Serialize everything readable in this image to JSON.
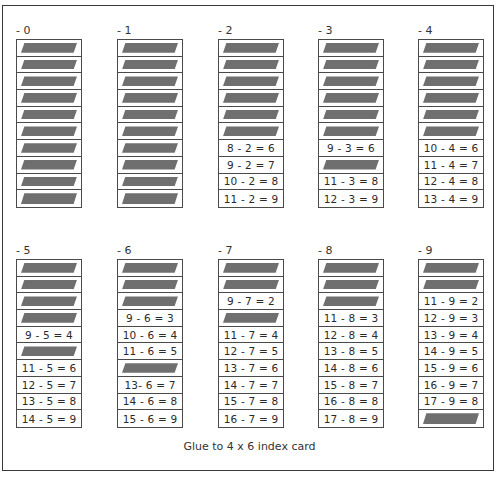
{
  "card": {
    "footer_text": "Glue to 4 x 6 index card"
  },
  "colors": {
    "bar": "#6f6f6f",
    "border": "#4a4a4a",
    "text": "#2a2a2a"
  },
  "columns": [
    {
      "label": "- 0",
      "cells": [
        {
          "type": "bar"
        },
        {
          "type": "bar"
        },
        {
          "type": "bar"
        },
        {
          "type": "bar"
        },
        {
          "type": "bar"
        },
        {
          "type": "bar"
        },
        {
          "type": "bar"
        },
        {
          "type": "bar"
        },
        {
          "type": "bar"
        },
        {
          "type": "bar"
        }
      ]
    },
    {
      "label": "- 1",
      "cells": [
        {
          "type": "bar"
        },
        {
          "type": "bar"
        },
        {
          "type": "bar"
        },
        {
          "type": "bar"
        },
        {
          "type": "bar"
        },
        {
          "type": "bar"
        },
        {
          "type": "bar"
        },
        {
          "type": "bar"
        },
        {
          "type": "bar"
        },
        {
          "type": "bar"
        }
      ]
    },
    {
      "label": "- 2",
      "cells": [
        {
          "type": "bar"
        },
        {
          "type": "bar"
        },
        {
          "type": "bar"
        },
        {
          "type": "bar"
        },
        {
          "type": "bar"
        },
        {
          "type": "bar"
        },
        {
          "type": "text",
          "text": "8 - 2 = 6"
        },
        {
          "type": "text",
          "text": "9 - 2 = 7"
        },
        {
          "type": "text",
          "text": "10 - 2 = 8"
        },
        {
          "type": "text",
          "text": "11 - 2 = 9"
        }
      ]
    },
    {
      "label": "- 3",
      "cells": [
        {
          "type": "bar"
        },
        {
          "type": "bar"
        },
        {
          "type": "bar"
        },
        {
          "type": "bar"
        },
        {
          "type": "bar"
        },
        {
          "type": "bar"
        },
        {
          "type": "text",
          "text": "9 - 3 = 6"
        },
        {
          "type": "bar"
        },
        {
          "type": "text",
          "text": "11 - 3 = 8"
        },
        {
          "type": "text",
          "text": "12 - 3 = 9"
        }
      ]
    },
    {
      "label": "- 4",
      "cells": [
        {
          "type": "bar"
        },
        {
          "type": "bar"
        },
        {
          "type": "bar"
        },
        {
          "type": "bar"
        },
        {
          "type": "bar"
        },
        {
          "type": "bar"
        },
        {
          "type": "text",
          "text": "10 - 4 = 6"
        },
        {
          "type": "text",
          "text": "11 - 4 = 7"
        },
        {
          "type": "text",
          "text": "12 - 4 = 8"
        },
        {
          "type": "text",
          "text": "13 - 4 = 9"
        }
      ]
    },
    {
      "label": "- 5",
      "cells": [
        {
          "type": "bar"
        },
        {
          "type": "bar"
        },
        {
          "type": "bar"
        },
        {
          "type": "bar"
        },
        {
          "type": "text",
          "text": "9 - 5 = 4"
        },
        {
          "type": "bar"
        },
        {
          "type": "text",
          "text": "11 - 5 = 6"
        },
        {
          "type": "text",
          "text": "12 - 5 = 7"
        },
        {
          "type": "text",
          "text": "13 - 5 = 8"
        },
        {
          "type": "text",
          "text": "14 - 5 = 9"
        }
      ]
    },
    {
      "label": "- 6",
      "cells": [
        {
          "type": "bar"
        },
        {
          "type": "bar"
        },
        {
          "type": "bar"
        },
        {
          "type": "text",
          "text": "9 - 6 = 3"
        },
        {
          "type": "text",
          "text": "10 - 6 = 4"
        },
        {
          "type": "text",
          "text": "11 - 6 = 5"
        },
        {
          "type": "bar"
        },
        {
          "type": "text",
          "text": "13- 6 = 7"
        },
        {
          "type": "text",
          "text": "14 - 6 = 8"
        },
        {
          "type": "text",
          "text": "15 - 6 = 9"
        }
      ]
    },
    {
      "label": "- 7",
      "cells": [
        {
          "type": "bar"
        },
        {
          "type": "bar"
        },
        {
          "type": "text",
          "text": "9 - 7 = 2"
        },
        {
          "type": "bar"
        },
        {
          "type": "text",
          "text": "11 - 7 = 4"
        },
        {
          "type": "text",
          "text": "12 - 7 = 5"
        },
        {
          "type": "text",
          "text": "13 - 7 = 6"
        },
        {
          "type": "text",
          "text": "14 - 7 = 7"
        },
        {
          "type": "text",
          "text": "15 - 7 = 8"
        },
        {
          "type": "text",
          "text": "16 - 7 = 9"
        }
      ]
    },
    {
      "label": "- 8",
      "cells": [
        {
          "type": "bar"
        },
        {
          "type": "bar"
        },
        {
          "type": "bar"
        },
        {
          "type": "text",
          "text": "11 - 8 = 3"
        },
        {
          "type": "text",
          "text": "12 - 8 = 4"
        },
        {
          "type": "text",
          "text": "13 - 8 = 5"
        },
        {
          "type": "text",
          "text": "14 - 8 = 6"
        },
        {
          "type": "text",
          "text": "15 - 8 = 7"
        },
        {
          "type": "text",
          "text": "16 - 8 = 8"
        },
        {
          "type": "text",
          "text": "17 - 8 = 9"
        }
      ]
    },
    {
      "label": "- 9",
      "cells": [
        {
          "type": "bar"
        },
        {
          "type": "bar"
        },
        {
          "type": "text",
          "text": "11 - 9 = 2"
        },
        {
          "type": "text",
          "text": "12 - 9 = 3"
        },
        {
          "type": "text",
          "text": "13 - 9 = 4"
        },
        {
          "type": "text",
          "text": "14 - 9 = 5"
        },
        {
          "type": "text",
          "text": "15 - 9 = 6"
        },
        {
          "type": "text",
          "text": "16 - 9 = 7"
        },
        {
          "type": "text",
          "text": "17 - 9 = 8"
        },
        {
          "type": "bar"
        }
      ]
    }
  ]
}
